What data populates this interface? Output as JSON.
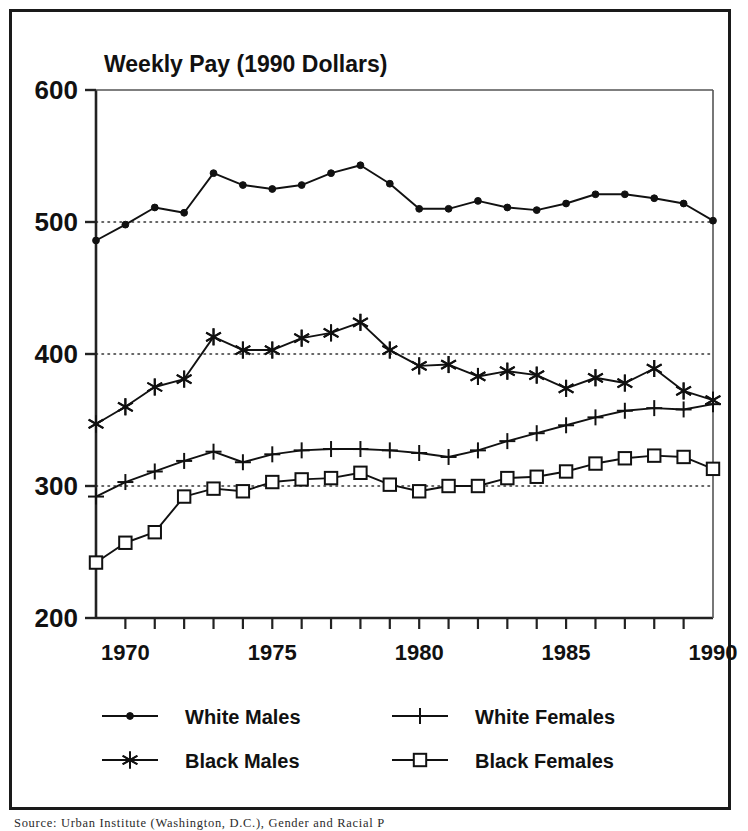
{
  "chart_data": {
    "type": "line",
    "title": "Weekly Pay (1990 Dollars)",
    "xlabel": "",
    "ylabel": "",
    "xlim": [
      1969,
      1990
    ],
    "ylim": [
      200,
      600
    ],
    "yticks": [
      200,
      300,
      400,
      500,
      600
    ],
    "ytick_labels": [
      "200",
      "300",
      "400",
      "500",
      "600"
    ],
    "xticks": [
      1969,
      1970,
      1971,
      1972,
      1973,
      1974,
      1975,
      1976,
      1977,
      1978,
      1979,
      1980,
      1981,
      1982,
      1983,
      1984,
      1985,
      1986,
      1987,
      1988,
      1989,
      1990
    ],
    "xtick_labels": [
      "1970",
      "1975",
      "1980",
      "1985",
      "1990"
    ],
    "xtick_label_values": [
      1970,
      1975,
      1980,
      1985,
      1990
    ],
    "grid": "horizontal-dotted at 300, 400, 500",
    "gridlines": [
      300,
      400,
      500
    ],
    "legend_position": "below-plot-two-columns",
    "x": [
      1969,
      1970,
      1971,
      1972,
      1973,
      1974,
      1975,
      1976,
      1977,
      1978,
      1979,
      1980,
      1981,
      1982,
      1983,
      1984,
      1985,
      1986,
      1987,
      1988,
      1989,
      1990
    ],
    "series": [
      {
        "name": "White Males",
        "marker": "dot",
        "values": [
          486,
          498,
          511,
          507,
          537,
          528,
          525,
          528,
          537,
          543,
          529,
          510,
          510,
          516,
          511,
          509,
          514,
          521,
          521,
          518,
          514,
          501
        ]
      },
      {
        "name": "Black Males",
        "marker": "asterisk",
        "values": [
          347,
          360,
          375,
          381,
          413,
          403,
          403,
          412,
          416,
          424,
          403,
          391,
          392,
          383,
          387,
          384,
          374,
          382,
          378,
          389,
          372,
          365
        ]
      },
      {
        "name": "White Females",
        "marker": "plus",
        "values": [
          292,
          303,
          311,
          319,
          326,
          318,
          324,
          327,
          328,
          328,
          327,
          325,
          322,
          327,
          334,
          340,
          346,
          352,
          357,
          359,
          358,
          362
        ]
      },
      {
        "name": "Black Females",
        "marker": "square",
        "values": [
          242,
          257,
          265,
          292,
          298,
          296,
          303,
          305,
          306,
          310,
          301,
          296,
          300,
          300,
          306,
          307,
          311,
          317,
          321,
          323,
          322,
          313
        ]
      }
    ]
  },
  "legend": {
    "items": [
      {
        "label": "White Males",
        "marker": "dot"
      },
      {
        "label": "White Females",
        "marker": "plus"
      },
      {
        "label": "Black Males",
        "marker": "asterisk"
      },
      {
        "label": "Black Females",
        "marker": "square"
      }
    ]
  },
  "footnote": {
    "text": "Source: Urban Institute (Washington, D.C.), Gender and Racial P"
  },
  "colors": {
    "line": "#111111",
    "frame": "#1a1a1a",
    "grid": "#333333",
    "background": "#ffffff"
  }
}
